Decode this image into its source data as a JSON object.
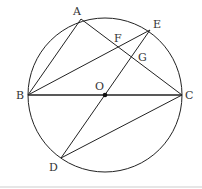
{
  "diagram": {
    "type": "geometry",
    "circle": {
      "center": "O",
      "cx": 105,
      "cy": 95,
      "r": 77
    },
    "points": {
      "A": {
        "label": "A",
        "x": 81,
        "y": 19
      },
      "B": {
        "label": "B",
        "x": 28,
        "y": 95
      },
      "C": {
        "label": "C",
        "x": 182,
        "y": 95
      },
      "D": {
        "label": "D",
        "x": 61,
        "y": 158
      },
      "E": {
        "label": "E",
        "x": 150,
        "y": 30
      },
      "F": {
        "label": "F",
        "x": 118,
        "y": 47
      },
      "G": {
        "label": "G",
        "x": 132,
        "y": 57
      },
      "O": {
        "label": "O",
        "x": 105,
        "y": 95
      }
    },
    "segments": [
      [
        "A",
        "B"
      ],
      [
        "A",
        "C"
      ],
      [
        "B",
        "E"
      ],
      [
        "B",
        "C"
      ],
      [
        "E",
        "D"
      ],
      [
        "D",
        "C"
      ]
    ],
    "colors": {
      "stroke": "#222222",
      "label": "#333333"
    }
  }
}
